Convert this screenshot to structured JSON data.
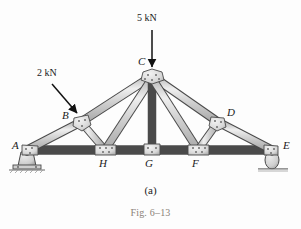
{
  "figure": {
    "type": "truss-free-body-diagram",
    "subfigure_label": "(a)",
    "figure_number": "Fig. 6–13",
    "background_color": "#fdfdfd",
    "member_fill": "#c9c9c9",
    "member_stroke": "#4a4a4a",
    "gusset_fill": "#dedede",
    "label_color": "#1a1a1a",
    "caption_color": "#8a8278"
  },
  "loads": [
    {
      "id": "load-5kn",
      "label": "5 kN",
      "magnitude": 5,
      "unit": "kN",
      "direction": "down",
      "applied_at_joint": "C",
      "label_x": 138,
      "label_y": 17,
      "arrow": {
        "x1": 152,
        "y1": 30,
        "x2": 152,
        "y2": 68
      }
    },
    {
      "id": "load-2kn",
      "label": "2 kN",
      "magnitude": 2,
      "unit": "kN",
      "direction": "down-right",
      "applied_at_joint": "B",
      "label_x": 42,
      "label_y": 72,
      "arrow": {
        "x1": 52,
        "y1": 84,
        "x2": 78,
        "y2": 114
      }
    }
  ],
  "joints": [
    {
      "id": "A",
      "label": "A",
      "x": 27,
      "y": 150,
      "label_x": 13,
      "label_y": 144,
      "support": "pin"
    },
    {
      "id": "B",
      "label": "B",
      "x": 81,
      "y": 122,
      "label_x": 63,
      "label_y": 113,
      "support": "none"
    },
    {
      "id": "C",
      "label": "C",
      "x": 152,
      "y": 76,
      "label_x": 139,
      "label_y": 59,
      "support": "none"
    },
    {
      "id": "D",
      "label": "D",
      "x": 218,
      "y": 122,
      "label_x": 227,
      "label_y": 110,
      "support": "none"
    },
    {
      "id": "E",
      "label": "E",
      "x": 272,
      "y": 150,
      "label_x": 283,
      "label_y": 144,
      "support": "roller"
    },
    {
      "id": "F",
      "label": "F",
      "x": 198,
      "y": 150,
      "label_x": 193,
      "label_y": 160,
      "support": "none"
    },
    {
      "id": "G",
      "label": "G",
      "x": 152,
      "y": 150,
      "label_x": 146,
      "label_y": 160,
      "support": "none"
    },
    {
      "id": "H",
      "label": "H",
      "x": 105,
      "y": 150,
      "label_x": 100,
      "label_y": 160,
      "support": "none"
    }
  ],
  "members": [
    {
      "id": "member-A-B",
      "from": "A",
      "to": "B"
    },
    {
      "id": "member-B-C",
      "from": "B",
      "to": "C"
    },
    {
      "id": "member-C-D",
      "from": "C",
      "to": "D"
    },
    {
      "id": "member-D-E",
      "from": "D",
      "to": "E"
    },
    {
      "id": "member-A-H",
      "from": "A",
      "to": "H"
    },
    {
      "id": "member-H-G",
      "from": "H",
      "to": "G"
    },
    {
      "id": "member-G-F",
      "from": "G",
      "to": "F"
    },
    {
      "id": "member-F-E",
      "from": "F",
      "to": "E"
    },
    {
      "id": "member-B-H",
      "from": "B",
      "to": "H"
    },
    {
      "id": "member-H-C",
      "from": "H",
      "to": "C"
    },
    {
      "id": "member-C-G",
      "from": "C",
      "to": "G"
    },
    {
      "id": "member-C-F",
      "from": "C",
      "to": "F"
    },
    {
      "id": "member-F-D",
      "from": "F",
      "to": "D"
    }
  ],
  "supports": [
    {
      "id": "support-pin-A",
      "type": "pin",
      "joint": "A",
      "x": 27,
      "y": 150
    },
    {
      "id": "support-roller-E",
      "type": "roller",
      "joint": "E",
      "x": 272,
      "y": 150
    }
  ]
}
